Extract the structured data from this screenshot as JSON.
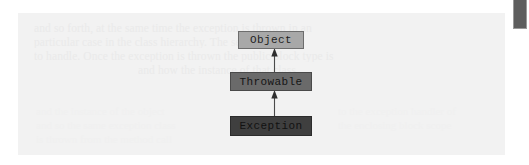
{
  "page": {
    "background_color": "#ffffff",
    "panel_color": "#f2f2f2"
  },
  "diagram": {
    "type": "uml-class-inheritance",
    "title": "",
    "nodes": [
      {
        "id": "object",
        "label": "Object",
        "fill_color": "#a8a8a8",
        "border_color": "#6d6d6d",
        "level": 0
      },
      {
        "id": "throwable",
        "label": "Throwable",
        "fill_color": "#6a6a6a",
        "border_color": "#4a4a4a",
        "level": 1
      },
      {
        "id": "exception",
        "label": "Exception",
        "fill_color": "#3f3f3f",
        "border_color": "#2c2c2c",
        "level": 2
      }
    ],
    "edges": [
      {
        "id": "throwable-object",
        "from": "throwable",
        "to": "object",
        "relation": "extends",
        "arrow": "up-arrowhead",
        "color": "#4a4a4a"
      },
      {
        "id": "exception-throwable",
        "from": "exception",
        "to": "throwable",
        "relation": "extends",
        "arrow": "up-arrowhead",
        "color": "#4a4a4a"
      }
    ]
  },
  "background_text": {
    "note": "illegible faint bleed-through body text",
    "lines": [
      "and so forth, at the same time the exception is thrown in an",
      "particular case in the class hierarchy. The second there",
      "to handle. Once the exception is thrown the public block type is",
      "and how the instance of that class"
    ],
    "blocks": [
      "and the instance of the object",
      "and so the same exception class",
      "is thrown from the method call",
      "to the exception handler of",
      "the enclosing block scope"
    ]
  },
  "scrollbar": {
    "orientation": "vertical",
    "thumb_color": "#5e5e5e",
    "position": "top"
  }
}
